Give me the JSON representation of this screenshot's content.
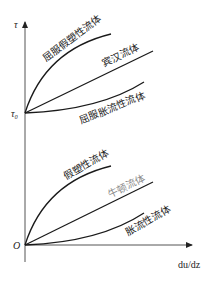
{
  "diagram": {
    "type": "rheology flow curves",
    "axes": {
      "y_label": "τ",
      "y_intercept_label": "τ₀",
      "origin_label": "O",
      "x_label": "du/dz"
    },
    "upper_group": {
      "start_point": "τ₀",
      "curves": [
        {
          "label": "屈服假塑性流体",
          "shape": "concave-down"
        },
        {
          "label": "宾汉流体",
          "shape": "linear"
        },
        {
          "label": "屈服胀流性流体",
          "shape": "concave-up"
        }
      ]
    },
    "lower_group": {
      "start_point": "O",
      "curves": [
        {
          "label": "假塑性流体",
          "shape": "concave-down"
        },
        {
          "label": "牛顿流体",
          "shape": "linear",
          "label_color": "#8a8a8a"
        },
        {
          "label": "胀流性流体",
          "shape": "concave-up"
        }
      ]
    }
  }
}
